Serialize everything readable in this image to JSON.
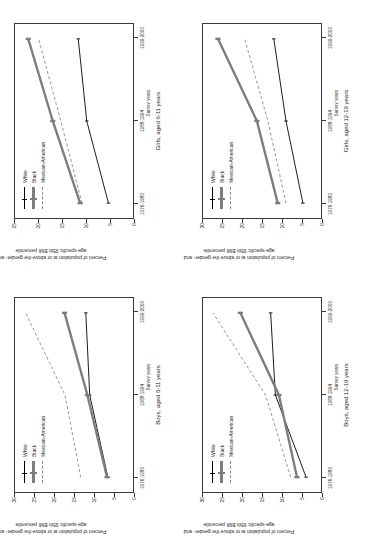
{
  "figure": {
    "y_axis_title_line1": "Percent of population at or above the gender- and",
    "y_axis_title_line2": "age-specific 95th BMI percentile",
    "x_axis_title": "Survey years",
    "legend": [
      {
        "label": "White",
        "key": "white-line-key"
      },
      {
        "label": "Black",
        "key": "black-line-key"
      },
      {
        "label": "Mexican-American",
        "key": "mexican-american-line-key"
      }
    ],
    "colors": {
      "white": "#000000",
      "black": "#7d7d7d",
      "mexican": "#8a8a8a",
      "axis": "#3a3a3a"
    }
  },
  "chart_data": [
    {
      "id": "girls-6-11",
      "type": "line",
      "title": "Girls, aged 6-11 years",
      "xlabel": "Survey years",
      "ylabel": "Percent of population at or above the gender- and age-specific 95th BMI percentile",
      "categories": [
        "1976-1980",
        "1988-1994",
        "1999-2000"
      ],
      "yticks": [
        0,
        5,
        10,
        15,
        20,
        25
      ],
      "ylim": [
        0,
        25
      ],
      "grid": false,
      "legend_position": "top-left",
      "series": [
        {
          "name": "White",
          "values": [
            5.2,
            9.8,
            11.6
          ]
        },
        {
          "name": "Black",
          "values": [
            11.2,
            17.0,
            22.2
          ]
        },
        {
          "name": "Mexican-American",
          "values": [
            10.8,
            15.3,
            20.0
          ]
        }
      ]
    },
    {
      "id": "girls-12-19",
      "type": "line",
      "title": "Girls, aged 12-19 years",
      "xlabel": "Survey years",
      "ylabel": "Percent of population at or above the gender- and age-specific 95th BMI percentile",
      "categories": [
        "1976-1980",
        "1988-1994",
        "1999-2000"
      ],
      "yticks": [
        0,
        5,
        10,
        15,
        20,
        25,
        30
      ],
      "ylim": [
        0,
        30
      ],
      "grid": false,
      "legend_position": "top-left",
      "series": [
        {
          "name": "White",
          "values": [
            4.6,
            8.9,
            12.0
          ]
        },
        {
          "name": "Black",
          "values": [
            11.0,
            16.3,
            26.2
          ]
        },
        {
          "name": "Mexican-American",
          "values": [
            8.9,
            13.5,
            19.4
          ]
        }
      ]
    },
    {
      "id": "boys-6-11",
      "type": "line",
      "title": "Boys, aged 6-11 years",
      "xlabel": "Survey years",
      "ylabel": "Percent of population at or above the gender- and age-specific 95th BMI percentile",
      "categories": [
        "1976-1980",
        "1988-1994",
        "1999-2000"
      ],
      "yticks": [
        0,
        5,
        10,
        15,
        20,
        25,
        30
      ],
      "ylim": [
        0,
        30
      ],
      "grid": false,
      "legend_position": "top-left",
      "series": [
        {
          "name": "White",
          "values": [
            6.4,
            11.0,
            12.0
          ]
        },
        {
          "name": "Black",
          "values": [
            6.6,
            11.6,
            17.4
          ]
        },
        {
          "name": "Mexican-American",
          "values": [
            13.3,
            17.3,
            27.3
          ]
        }
      ]
    },
    {
      "id": "boys-12-19",
      "type": "line",
      "title": "Boys, aged 12-19 years",
      "xlabel": "Survey years",
      "ylabel": "Percent of population at or above the gender- and age-specific 95th BMI percentile",
      "categories": [
        "1976-1980",
        "1988-1994",
        "1999-2000"
      ],
      "yticks": [
        0,
        5,
        10,
        15,
        20,
        25,
        30
      ],
      "ylim": [
        0,
        30
      ],
      "grid": false,
      "legend_position": "top-left",
      "series": [
        {
          "name": "White",
          "values": [
            3.8,
            11.6,
            12.8
          ]
        },
        {
          "name": "Black",
          "values": [
            6.1,
            10.7,
            20.5
          ]
        },
        {
          "name": "Mexican-American",
          "values": [
            7.7,
            14.1,
            27.5
          ]
        }
      ]
    }
  ]
}
